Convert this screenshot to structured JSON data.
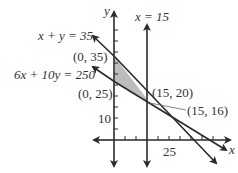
{
  "diagram": {
    "type": "linear-programming-feasible-region",
    "axes": {
      "x_label": "x",
      "y_label": "y"
    },
    "ticks": {
      "x_tick_label": "25",
      "y_tick_label": "10"
    },
    "lines": [
      {
        "id": "line-x-plus-y",
        "label": "x + y = 35"
      },
      {
        "id": "line-6x-10y",
        "label": "6x + 10y = 250"
      },
      {
        "id": "line-x-15",
        "label": "x = 15"
      }
    ],
    "points": [
      {
        "label": "(0, 35)"
      },
      {
        "label": "(0, 25)"
      },
      {
        "label": "(15, 20)"
      },
      {
        "label": "(15, 16)"
      }
    ],
    "colors": {
      "line": "#2a2a2a",
      "shade": "#bdbdbd",
      "leader": "#666666"
    }
  }
}
